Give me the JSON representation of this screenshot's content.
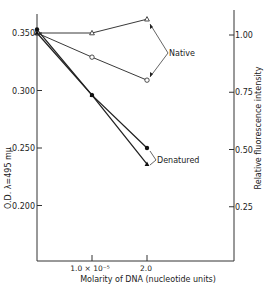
{
  "chart_data": {
    "type": "line",
    "title": "",
    "xlabel": "Molarity of DNA (nucleotide units)",
    "ylabel": "O.D. λ=495 mμ",
    "y2label": "Relative fluorescence intensity",
    "x": [
      0,
      1.0,
      2.0
    ],
    "x_tick_labels": [
      "1.0 × 10⁻⁵",
      "2.0"
    ],
    "x_ticks": [
      1.0,
      2.0
    ],
    "xlim": [
      0,
      3.5
    ],
    "ylim": [
      0.16,
      0.365
    ],
    "y_ticks": [
      0.2,
      0.25,
      0.3,
      0.35
    ],
    "y_tick_labels": [
      "0.200",
      "0.250",
      "0.300",
      "0.350"
    ],
    "y2_ticks": [
      0.25,
      0.5,
      0.75,
      1.0
    ],
    "y2_tick_labels": [
      "0.25",
      "0.50",
      "0.75",
      "1.00"
    ],
    "grid": false,
    "series": [
      {
        "name": "Native (open triangle)",
        "group": "Native",
        "marker": "open-triangle",
        "values": [
          0.35,
          0.35,
          0.362
        ]
      },
      {
        "name": "Native (open circle)",
        "group": "Native",
        "marker": "open-circle",
        "values": [
          0.35,
          0.329,
          0.309
        ]
      },
      {
        "name": "Denatured (filled circle)",
        "group": "Denatured",
        "marker": "filled-circle",
        "values": [
          0.353,
          0.296,
          0.25
        ]
      },
      {
        "name": "Denatured (filled triangle)",
        "group": "Denatured",
        "marker": "filled-triangle",
        "values": [
          0.35,
          0.296,
          0.236
        ]
      }
    ],
    "annotations": [
      "Native",
      "Denatured"
    ]
  }
}
